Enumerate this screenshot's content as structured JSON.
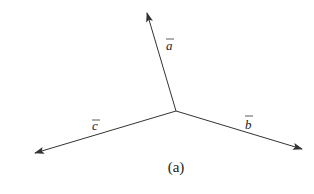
{
  "figure": {
    "caption": "(a)",
    "origin": [
      176,
      111
    ],
    "line_color": "#333333",
    "vectors": [
      {
        "name": "a",
        "label": "a",
        "tip": [
          147,
          13
        ],
        "label_pos": [
          170,
          50
        ]
      },
      {
        "name": "b",
        "label": "b",
        "tip": [
          302,
          149
        ],
        "label_pos": [
          248,
          129
        ]
      },
      {
        "name": "c",
        "label": "c",
        "tip": [
          35,
          153
        ],
        "label_pos": [
          95,
          129
        ]
      }
    ]
  }
}
